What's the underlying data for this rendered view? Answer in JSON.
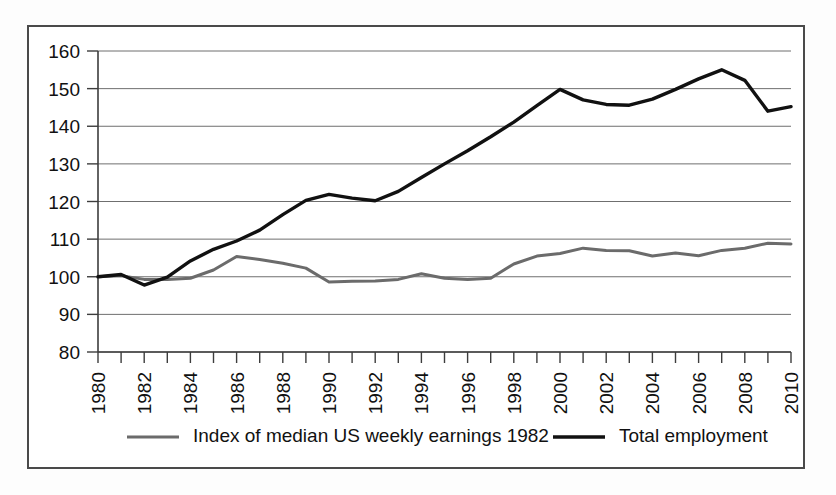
{
  "chart_data": {
    "type": "line",
    "title": "",
    "subtitle": "",
    "xlabel": "",
    "ylabel": "",
    "xlim": [
      1980,
      2010
    ],
    "ylim": [
      80,
      160
    ],
    "grid": true,
    "legend_position": "bottom",
    "y_ticks": [
      80,
      90,
      100,
      110,
      120,
      130,
      140,
      150,
      160
    ],
    "x_ticks": [
      1980,
      1982,
      1984,
      1986,
      1988,
      1990,
      1992,
      1994,
      1996,
      1998,
      2000,
      2002,
      2004,
      2006,
      2008,
      2010
    ],
    "x_tick_labels": [
      "1980",
      "1982",
      "1984",
      "1986",
      "1988",
      "1990",
      "1992",
      "1994",
      "1996",
      "1998",
      "2000",
      "2002",
      "2004",
      "2006",
      "2008",
      "2010"
    ],
    "y_tick_labels": [
      "80",
      "90",
      "100",
      "110",
      "120",
      "130",
      "140",
      "150",
      "160"
    ],
    "x": [
      1980,
      1981,
      1982,
      1983,
      1984,
      1985,
      1986,
      1987,
      1988,
      1989,
      1990,
      1991,
      1992,
      1993,
      1994,
      1995,
      1996,
      1997,
      1998,
      1999,
      2000,
      2001,
      2002,
      2003,
      2004,
      2005,
      2006,
      2007,
      2008,
      2009,
      2010
    ],
    "series": [
      {
        "name": "Index of median US weekly earnings 1982",
        "color": "#6b6b6b",
        "width": 3.0,
        "values": [
          100.0,
          100.3,
          99.3,
          99.3,
          99.6,
          101.8,
          105.4,
          104.6,
          103.6,
          102.3,
          98.6,
          98.8,
          98.9,
          99.3,
          100.8,
          99.6,
          99.3,
          99.6,
          103.4,
          105.5,
          106.2,
          107.6,
          107.0,
          106.9,
          105.5,
          106.3,
          105.6,
          107.0,
          107.6,
          108.9,
          108.7
        ]
      },
      {
        "name": "Total employment",
        "color": "#111111",
        "width": 3.4,
        "values": [
          100.0,
          100.6,
          97.8,
          99.9,
          104.2,
          107.3,
          109.5,
          112.4,
          116.5,
          120.3,
          121.9,
          120.9,
          120.2,
          122.7,
          126.4,
          130.0,
          133.5,
          137.2,
          141.1,
          145.5,
          149.8,
          147.0,
          145.8,
          145.6,
          147.2,
          149.8,
          152.6,
          155.0,
          152.2,
          144.0,
          145.2
        ]
      }
    ]
  },
  "legend": {
    "entries": [
      {
        "label": "Index of median US weekly earnings 1982",
        "color": "#6b6b6b",
        "swatch": "line-swatch-gray"
      },
      {
        "label": "Total employment",
        "color": "#111111",
        "swatch": "line-swatch-black"
      }
    ]
  },
  "colors": {
    "frame_border": "#4a4a4a",
    "gridline": "#6f6f6f",
    "axis": "#3d3d3d",
    "background": "#ffffff",
    "text": "#111111"
  }
}
